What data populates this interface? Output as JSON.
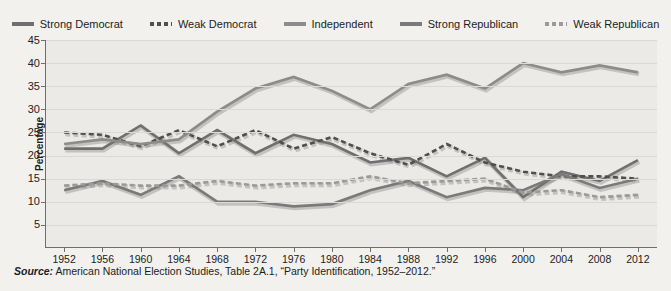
{
  "legend": {
    "items": [
      {
        "label": "Strong Democrat",
        "style": "solid",
        "color": "#6f6f6f"
      },
      {
        "label": "Weak Democrat",
        "style": "dashed",
        "color": "#4f4f4f"
      },
      {
        "label": "Independent",
        "style": "solid",
        "color": "#8c8c8c"
      },
      {
        "label": "Strong Republican",
        "style": "solid",
        "color": "#7a7a7a"
      },
      {
        "label": "Weak Republican",
        "style": "dashed",
        "color": "#9a9a9a"
      }
    ]
  },
  "source": {
    "prefix": "Source:",
    "text": " American National Election Studies, Table 2A.1, “Party Identification, 1952–2012.”"
  },
  "chart_data": {
    "type": "line",
    "title": "",
    "xlabel": "",
    "ylabel": "Percentage",
    "xlim": [
      1952,
      2012
    ],
    "ylim": [
      0,
      45
    ],
    "yticks": [
      5,
      10,
      15,
      20,
      25,
      30,
      35,
      40,
      45
    ],
    "grid": true,
    "legend_position": "top",
    "x": [
      1952,
      1956,
      1960,
      1964,
      1968,
      1972,
      1976,
      1980,
      1984,
      1988,
      1992,
      1996,
      2000,
      2004,
      2008,
      2012
    ],
    "categories": [
      "1952",
      "1956",
      "1960",
      "1964",
      "1968",
      "1972",
      "1976",
      "1980",
      "1984",
      "1988",
      "1992",
      "1996",
      "2000",
      "2004",
      "2008",
      "2012"
    ],
    "series": [
      {
        "name": "Strong Democrat",
        "style": "solid",
        "color": "#6f6f6f",
        "values": [
          21.5,
          21.5,
          26.5,
          20.5,
          25.5,
          20.5,
          24.5,
          22.5,
          18.5,
          19.5,
          15.5,
          19.5,
          11.0,
          16.5,
          14.5,
          19.0
        ]
      },
      {
        "name": "Weak Democrat",
        "style": "dashed",
        "color": "#4f4f4f",
        "values": [
          25.0,
          24.5,
          22.0,
          25.5,
          22.0,
          25.5,
          21.5,
          24.0,
          20.5,
          18.0,
          22.5,
          18.5,
          16.5,
          15.5,
          15.5,
          15.0
        ]
      },
      {
        "name": "Independent",
        "style": "solid",
        "color": "#8c8c8c",
        "values": [
          22.5,
          23.5,
          22.5,
          23.5,
          29.5,
          34.5,
          37.0,
          34.0,
          30.0,
          35.5,
          37.5,
          34.5,
          40.0,
          38.0,
          39.5,
          38.0
        ]
      },
      {
        "name": "Strong Republican",
        "style": "solid",
        "color": "#7a7a7a",
        "values": [
          12.5,
          14.5,
          11.5,
          15.5,
          10.0,
          10.0,
          9.0,
          9.5,
          12.5,
          14.5,
          11.0,
          13.0,
          12.5,
          16.0,
          13.0,
          15.0
        ]
      },
      {
        "name": "Weak Republican",
        "style": "dashed",
        "color": "#9a9a9a",
        "values": [
          13.5,
          14.0,
          13.5,
          13.5,
          14.5,
          13.5,
          14.0,
          14.0,
          15.5,
          14.0,
          14.5,
          15.0,
          12.0,
          12.5,
          11.0,
          11.5
        ]
      }
    ]
  }
}
